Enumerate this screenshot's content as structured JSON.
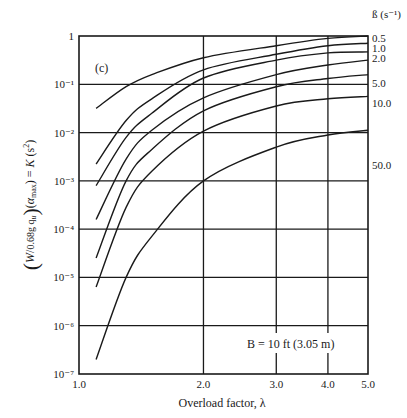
{
  "chart_data": {
    "type": "line",
    "panel_label": "(c)",
    "title": "",
    "xlabel": "Overload factor, λ",
    "ylabel": "(W / 0.68g q_u)(α_max) = K (s²)",
    "x_scale": "log",
    "y_scale": "log",
    "xlim": [
      1.0,
      5.0
    ],
    "ylim": [
      1e-07,
      1
    ],
    "x_ticks": [
      "1.0",
      "2.0",
      "3.0",
      "4.0",
      "5.0"
    ],
    "x_tick_values": [
      1.0,
      2.0,
      3.0,
      4.0,
      5.0
    ],
    "y_ticks": [
      "1",
      "10⁻¹",
      "10⁻²",
      "10⁻³",
      "10⁻⁴",
      "10⁻⁵",
      "10⁻⁶",
      "10⁻⁷"
    ],
    "y_tick_exponents": [
      0,
      -1,
      -2,
      -3,
      -4,
      -5,
      -6,
      -7
    ],
    "grid": true,
    "legend_title": "ß (s⁻¹)",
    "legend_position": "right",
    "annotation": "B = 10 ft (3.05 m)",
    "x": [
      1.1,
      1.3,
      1.5,
      2.0,
      3.0,
      4.0,
      5.0
    ],
    "series": [
      {
        "name": "0.5",
        "log10_values": [
          -1.5,
          -1.05,
          -0.8,
          -0.45,
          -0.2,
          -0.05,
          0.0
        ]
      },
      {
        "name": "1.0",
        "log10_values": [
          -2.65,
          -1.75,
          -1.3,
          -0.7,
          -0.38,
          -0.2,
          -0.15
        ]
      },
      {
        "name": "2.0",
        "log10_values": [
          -3.1,
          -2.1,
          -1.6,
          -0.87,
          -0.5,
          -0.35,
          -0.33
        ]
      },
      {
        "name": "",
        "log10_values": [
          -3.8,
          -2.55,
          -1.95,
          -1.28,
          -0.8,
          -0.6,
          -0.5
        ]
      },
      {
        "name": "5.0",
        "log10_values": [
          -4.6,
          -3.0,
          -2.35,
          -1.55,
          -1.05,
          -0.88,
          -0.8
        ]
      },
      {
        "name": "10.0",
        "log10_values": [
          -5.2,
          -3.55,
          -2.8,
          -1.97,
          -1.45,
          -1.3,
          -1.25
        ]
      },
      {
        "name": "50.0",
        "log10_values": [
          -6.7,
          -5.0,
          -4.15,
          -3.0,
          -2.3,
          -2.05,
          -1.95
        ]
      }
    ],
    "legend_label_y_px": [
      38,
      48,
      58,
      83,
      103,
      165
    ]
  }
}
